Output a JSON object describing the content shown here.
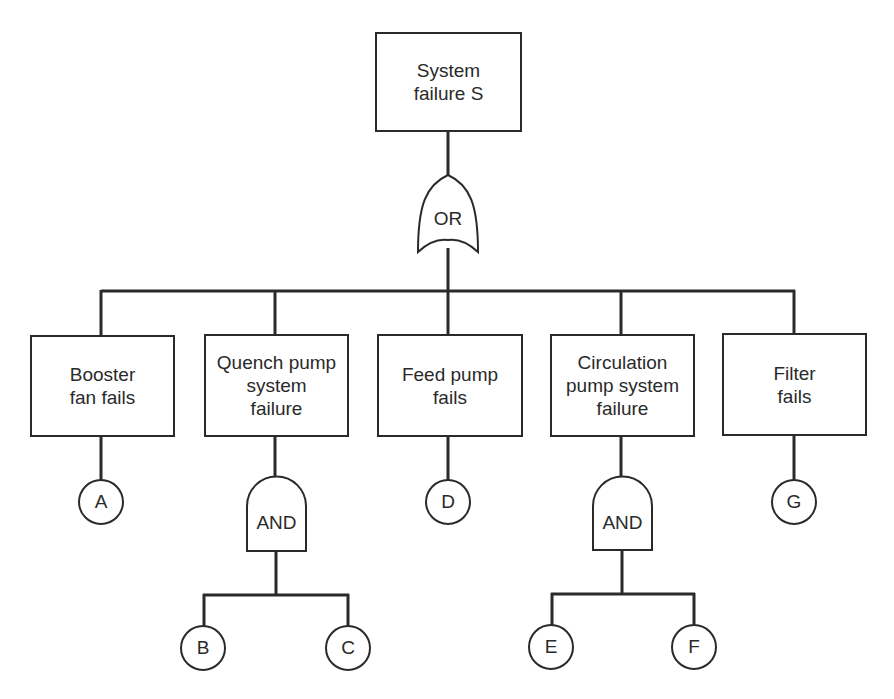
{
  "diagram": {
    "type": "fault-tree",
    "top_event": {
      "label": "System\nfailure  S"
    },
    "top_gate": {
      "type": "OR",
      "label": "OR"
    },
    "events": [
      {
        "id": "booster",
        "label": "Booster\nfan fails",
        "basic": "A"
      },
      {
        "id": "quench",
        "label": "Quench pump\nsystem\nfailure",
        "gate": "AND",
        "basics": [
          "B",
          "C"
        ]
      },
      {
        "id": "feed",
        "label": "Feed pump\nfails",
        "basic": "D"
      },
      {
        "id": "circulation",
        "label": "Circulation\npump system\nfailure",
        "gate": "AND",
        "basics": [
          "E",
          "F"
        ]
      },
      {
        "id": "filter",
        "label": "Filter\nfails",
        "basic": "G"
      }
    ],
    "gate_labels": {
      "and": "AND"
    },
    "basic_events": {
      "A": "A",
      "B": "B",
      "C": "C",
      "D": "D",
      "E": "E",
      "F": "F",
      "G": "G"
    },
    "colors": {
      "line": "#2a2a2a",
      "background": "#ffffff"
    }
  }
}
